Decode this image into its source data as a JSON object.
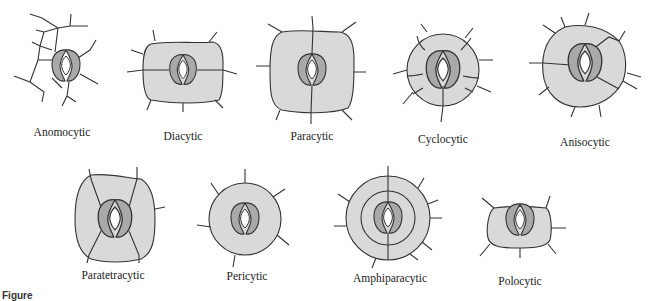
{
  "figure": {
    "caption_prefix": "Figure",
    "colors": {
      "subsidiary_cell_fill": "#d9d9d9",
      "guard_cell_fill": "#a9a9a9",
      "outline": "#333333",
      "background": "#ffffff"
    },
    "stomata_types": [
      {
        "label": "Anomocytic",
        "cx": 62,
        "cy": 67,
        "label_x": 62,
        "label_y": 133
      },
      {
        "label": "Diacytic",
        "cx": 183,
        "cy": 70,
        "label_x": 183,
        "label_y": 133
      },
      {
        "label": "Paracytic",
        "cx": 312,
        "cy": 70,
        "label_x": 312,
        "label_y": 133
      },
      {
        "label": "Cyclocytic",
        "cx": 443,
        "cy": 70,
        "label_x": 443,
        "label_y": 133
      },
      {
        "label": "Anisocytic",
        "cx": 585,
        "cy": 63,
        "label_x": 585,
        "label_y": 133
      },
      {
        "label": "Paratetracytic",
        "cx": 115,
        "cy": 219,
        "label_x": 115,
        "label_y": 277
      },
      {
        "label": "Pericytic",
        "cx": 245,
        "cy": 219,
        "label_x": 245,
        "label_y": 277
      },
      {
        "label": "Amphiparacytic",
        "cx": 388,
        "cy": 218,
        "label_x": 388,
        "label_y": 277
      },
      {
        "label": "Polocytic",
        "cx": 520,
        "cy": 224,
        "label_x": 520,
        "label_y": 277
      }
    ]
  }
}
